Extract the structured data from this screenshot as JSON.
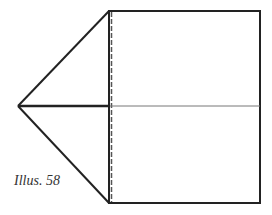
{
  "figure": {
    "caption": "Illus. 58",
    "colors": {
      "stroke": "#222222",
      "fold_line": "#777777",
      "background": "#ffffff"
    },
    "rectangle": {
      "x": 109,
      "y": 11,
      "width": 151,
      "height": 192
    },
    "apex": {
      "x": 18,
      "y": 106
    },
    "center_fold_y": 106
  }
}
